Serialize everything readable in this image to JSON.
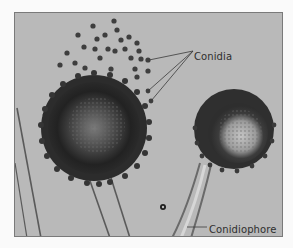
{
  "figure": {
    "labels": {
      "conidia": "Conidia",
      "conidiophore": "Conidiophore"
    },
    "colors": {
      "background": "#b9b9b9",
      "page": "#fafafa",
      "spore": "#3a3a3a",
      "label_text": "#2e2e2e",
      "leader_line": "#3a3a3a"
    }
  }
}
